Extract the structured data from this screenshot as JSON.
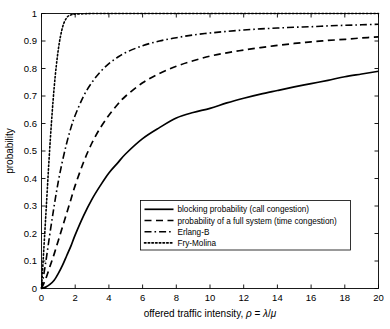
{
  "chart_data": {
    "type": "line",
    "title": "",
    "xlabel": "offered traffic intensity, ρ = λ/μ",
    "ylabel": "probability",
    "xlim": [
      0,
      20
    ],
    "ylim": [
      0,
      1
    ],
    "grid": false,
    "legend_position": "lower-right-inside",
    "xticks": [
      "0",
      "2",
      "4",
      "6",
      "8",
      "10",
      "12",
      "14",
      "16",
      "18",
      "20"
    ],
    "xtick_values": [
      0,
      2,
      4,
      6,
      8,
      10,
      12,
      14,
      16,
      18,
      20
    ],
    "yticks": [
      "0",
      "0.1",
      "0.2",
      "0.3",
      "0.4",
      "0.5",
      "0.6",
      "0.7",
      "0.8",
      "0.9",
      "1"
    ],
    "ytick_values": [
      0,
      0.1,
      0.2,
      0.3,
      0.4,
      0.5,
      0.6,
      0.7,
      0.8,
      0.9,
      1
    ],
    "x": [
      0,
      0.25,
      0.5,
      0.75,
      1,
      1.25,
      1.5,
      1.75,
      2,
      2.5,
      3,
      3.5,
      4,
      4.5,
      5,
      6,
      7,
      8,
      9,
      10,
      11,
      12,
      13,
      14,
      15,
      16,
      17,
      18,
      19,
      20
    ],
    "series": [
      {
        "name": "blocking probability (call congestion)",
        "style": "solid",
        "values": [
          0,
          0.005,
          0.015,
          0.03,
          0.055,
          0.085,
          0.12,
          0.155,
          0.195,
          0.265,
          0.325,
          0.375,
          0.42,
          0.455,
          0.49,
          0.545,
          0.585,
          0.62,
          0.64,
          0.655,
          0.675,
          0.692,
          0.707,
          0.72,
          0.733,
          0.745,
          0.757,
          0.77,
          0.78,
          0.79
        ]
      },
      {
        "name": "probability of a full system (time congestion)",
        "style": "dashed",
        "values": [
          0,
          0.035,
          0.08,
          0.125,
          0.175,
          0.225,
          0.275,
          0.325,
          0.375,
          0.46,
          0.53,
          0.585,
          0.63,
          0.668,
          0.7,
          0.748,
          0.782,
          0.808,
          0.828,
          0.845,
          0.857,
          0.867,
          0.876,
          0.884,
          0.891,
          0.897,
          0.902,
          0.906,
          0.911,
          0.915
        ]
      },
      {
        "name": "Erlang-B",
        "style": "dashdot",
        "values": [
          0,
          0.095,
          0.2,
          0.3,
          0.39,
          0.465,
          0.53,
          0.585,
          0.63,
          0.7,
          0.75,
          0.788,
          0.818,
          0.84,
          0.858,
          0.883,
          0.9,
          0.912,
          0.922,
          0.929,
          0.935,
          0.94,
          0.944,
          0.947,
          0.95,
          0.952,
          0.955,
          0.957,
          0.959,
          0.961
        ]
      },
      {
        "name": "Fry-Molina",
        "style": "dotted",
        "values": [
          0,
          0.26,
          0.52,
          0.73,
          0.87,
          0.95,
          0.985,
          0.995,
          0.998,
          0.999,
          1,
          1,
          1,
          1,
          1,
          1,
          1,
          1,
          1,
          1,
          1,
          1,
          1,
          1,
          1,
          1,
          1,
          1,
          1,
          1
        ]
      }
    ],
    "legend_entries": [
      "blocking probability (call congestion)",
      "probability of a full system (time congestion)",
      "Erlang-B",
      "Fry-Molina"
    ],
    "colors": {
      "line": "#000000",
      "background": "#ffffff",
      "axis": "#000000"
    }
  }
}
